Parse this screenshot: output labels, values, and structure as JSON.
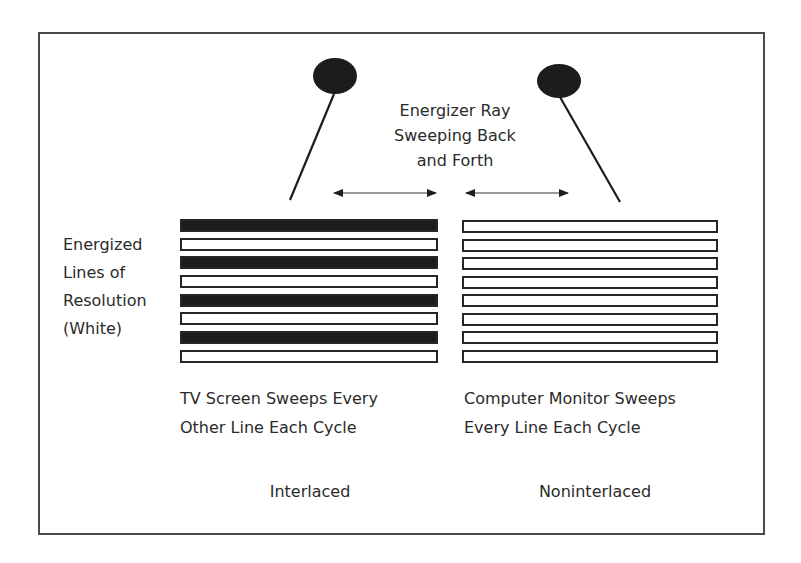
{
  "title_label": {
    "line1": "Energizer Ray",
    "line2": "Sweeping Back",
    "line3": "and Forth"
  },
  "side_label": {
    "line1": "Energized",
    "line2": "Lines of",
    "line3": "Resolution",
    "line4": "(White)"
  },
  "panels": [
    {
      "name": "interlaced",
      "caption_line1": "TV Screen Sweeps Every",
      "caption_line2": "Other Line Each Cycle",
      "label": "Interlaced",
      "lines": [
        "energized",
        "outline",
        "energized",
        "outline",
        "energized",
        "outline",
        "energized",
        "outline"
      ]
    },
    {
      "name": "noninterlaced",
      "caption_line1": "Computer Monitor Sweeps",
      "caption_line2": "Every Line Each Cycle",
      "label": "Noninterlaced",
      "lines": [
        "outline",
        "outline",
        "outline",
        "outline",
        "outline",
        "outline",
        "outline",
        "outline"
      ]
    }
  ],
  "colors": {
    "ink": "#1c1c1c",
    "border": "#4a4a4a",
    "background": "#ffffff"
  }
}
